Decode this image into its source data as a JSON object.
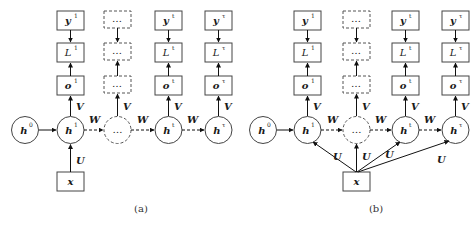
{
  "panels": [
    {
      "id": "a",
      "caption": "(a)",
      "hidden": [
        {
          "base": "h",
          "sup": "0"
        },
        {
          "base": "h",
          "sup": "1"
        },
        {
          "base": "…",
          "sup": ""
        },
        {
          "base": "h",
          "sup": "t"
        },
        {
          "base": "h",
          "sup": "τ"
        }
      ],
      "columns": [
        {
          "y": {
            "base": "y",
            "sup": "1"
          },
          "L": {
            "base": "L",
            "sup": "1"
          },
          "o": {
            "base": "o",
            "sup": "1"
          }
        },
        {
          "y": {
            "base": "…",
            "sup": ""
          },
          "L": {
            "base": "…",
            "sup": ""
          },
          "o": {
            "base": "…",
            "sup": ""
          }
        },
        {
          "y": {
            "base": "y",
            "sup": "t"
          },
          "L": {
            "base": "L",
            "sup": "t"
          },
          "o": {
            "base": "o",
            "sup": "t"
          }
        },
        {
          "y": {
            "base": "y",
            "sup": "τ"
          },
          "L": {
            "base": "L",
            "sup": "τ"
          },
          "o": {
            "base": "o",
            "sup": "τ"
          }
        }
      ],
      "input": "x",
      "edge_labels": {
        "V": "V",
        "W": "W",
        "U": "U"
      }
    },
    {
      "id": "b",
      "caption": "(b)",
      "hidden": [
        {
          "base": "h",
          "sup": "0"
        },
        {
          "base": "h",
          "sup": "1"
        },
        {
          "base": "…",
          "sup": ""
        },
        {
          "base": "h",
          "sup": "t"
        },
        {
          "base": "h",
          "sup": "τ"
        }
      ],
      "columns": [
        {
          "y": {
            "base": "y",
            "sup": "1"
          },
          "L": {
            "base": "L",
            "sup": "1"
          },
          "o": {
            "base": "o",
            "sup": "1"
          }
        },
        {
          "y": {
            "base": "…",
            "sup": ""
          },
          "L": {
            "base": "…",
            "sup": ""
          },
          "o": {
            "base": "…",
            "sup": ""
          }
        },
        {
          "y": {
            "base": "y",
            "sup": "t"
          },
          "L": {
            "base": "L",
            "sup": "t"
          },
          "o": {
            "base": "o",
            "sup": "t"
          }
        },
        {
          "y": {
            "base": "y",
            "sup": "τ"
          },
          "L": {
            "base": "L",
            "sup": "τ"
          },
          "o": {
            "base": "o",
            "sup": "τ"
          }
        }
      ],
      "input": "x",
      "edge_labels": {
        "V": "V",
        "W": "W",
        "U": "U"
      }
    }
  ]
}
